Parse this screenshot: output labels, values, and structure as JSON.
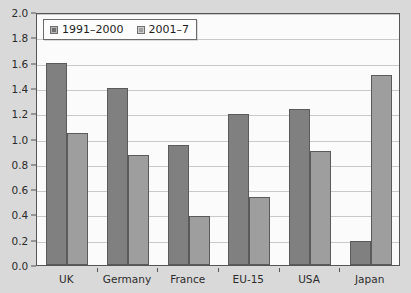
{
  "chart_data": {
    "type": "bar",
    "title": "",
    "subtitle": "",
    "xlabel": "",
    "ylabel": "",
    "categories": [
      "UK",
      "Germany",
      "France",
      "EU-15",
      "USA",
      "Japan"
    ],
    "series": [
      {
        "name": "1991–2000",
        "color": "#808080",
        "values": [
          1.6,
          1.4,
          0.95,
          1.19,
          1.23,
          0.19
        ]
      },
      {
        "name": "2001–7",
        "color": "#9e9e9e",
        "values": [
          1.04,
          0.87,
          0.39,
          0.54,
          0.9,
          1.5
        ]
      }
    ],
    "ylim": [
      0.0,
      2.0
    ],
    "ytick_step": 0.2,
    "yticks": [
      "0.0",
      "0.2",
      "0.4",
      "0.6",
      "0.8",
      "1.0",
      "1.2",
      "1.4",
      "1.6",
      "1.8",
      "2.0"
    ],
    "grid": true,
    "legend_position": "top-left",
    "plot_background": "#fbfbfb",
    "figure_background": "#d9d9d9",
    "axis_color": "#555555",
    "gridline_color": "#c9c9c9"
  },
  "legend": {
    "entries": [
      {
        "label": "1991–2000"
      },
      {
        "label": "2001–7"
      }
    ]
  }
}
